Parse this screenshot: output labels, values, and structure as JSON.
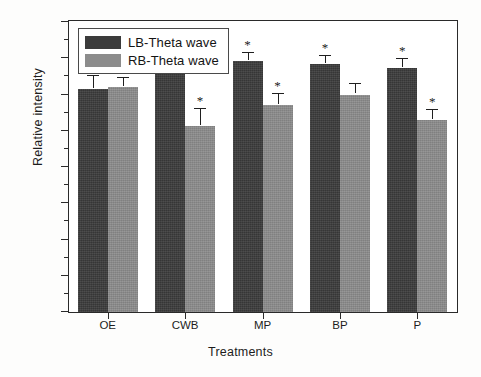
{
  "chart_data": {
    "type": "bar",
    "title": "",
    "xlabel": "Treatments",
    "ylabel": "Relative intensity",
    "categories": [
      "OE",
      "CWB",
      "MP",
      "BP",
      "P"
    ],
    "ylim": [
      0,
      40
    ],
    "ytick_labels": [
      "0",
      "5",
      "10",
      "15",
      "20",
      "25",
      "30",
      "35",
      "40"
    ],
    "ytick_values": [
      0,
      5,
      10,
      15,
      20,
      25,
      30,
      35,
      40
    ],
    "ytick_interval": 5,
    "minor_ticks_per_interval": 1,
    "grid": false,
    "legend_position": "top-left inside plot frame",
    "significance_marker": "*",
    "series": [
      {
        "name": "LB-Theta wave",
        "color": "#3b3b3b",
        "values": [
          30.7,
          33.3,
          34.6,
          34.2,
          33.7
        ],
        "errors": [
          1.9,
          1.3,
          1.1,
          1.1,
          1.2
        ],
        "significant": [
          false,
          true,
          true,
          true,
          true
        ]
      },
      {
        "name": "RB-Theta wave",
        "color": "#8c8c8c",
        "values": [
          31.1,
          25.7,
          28.5,
          30.0,
          26.5
        ],
        "errors": [
          1.2,
          2.3,
          1.6,
          1.4,
          1.4
        ],
        "significant": [
          false,
          true,
          true,
          false,
          true
        ]
      }
    ]
  }
}
